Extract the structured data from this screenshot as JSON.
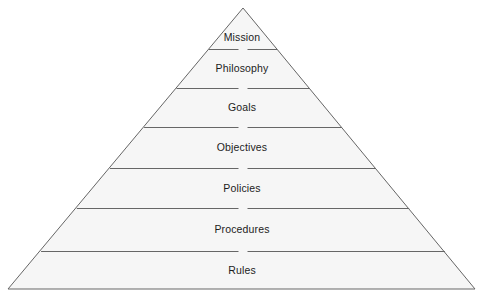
{
  "figure": {
    "name": "management-hierarchy-pyramid",
    "type": "pyramid-diagram",
    "background_color": "#ffffff",
    "fill_color": "#f6f6f6",
    "line_color": "#666666",
    "text_color": "#1c1c1c",
    "apex": {
      "x": 243,
      "y": 8
    },
    "base_left": {
      "x": 8,
      "y": 289
    },
    "base_right": {
      "x": 475,
      "y": 289
    },
    "divider_gap": 9,
    "tiers": [
      {
        "label": "Mission",
        "top_y": 8,
        "bottom_y": 49,
        "label_y": 31
      },
      {
        "label": "Philosophy",
        "top_y": 49,
        "bottom_y": 88,
        "label_y": 62
      },
      {
        "label": "Goals",
        "top_y": 88,
        "bottom_y": 127,
        "label_y": 101
      },
      {
        "label": "Objectives",
        "top_y": 127,
        "bottom_y": 168,
        "label_y": 141
      },
      {
        "label": "Policies",
        "top_y": 168,
        "bottom_y": 208,
        "label_y": 182
      },
      {
        "label": "Procedures",
        "top_y": 208,
        "bottom_y": 251,
        "label_y": 223
      },
      {
        "label": "Rules",
        "top_y": 251,
        "bottom_y": 289,
        "label_y": 264
      }
    ]
  }
}
